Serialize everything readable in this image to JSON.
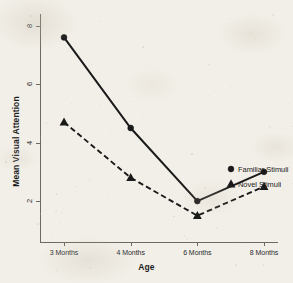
{
  "chart_data": {
    "type": "line",
    "title": "",
    "xlabel": "Age",
    "ylabel": "Mean Visual Attention",
    "categories": [
      "3 Months",
      "4 Months",
      "6 Months",
      "8 Months"
    ],
    "yticks": [
      "2",
      "4",
      "6",
      "8"
    ],
    "ylim": [
      0.6,
      8.4
    ],
    "grid": false,
    "legend_position": "right-inline",
    "series": [
      {
        "name": "Familiar Stimuli",
        "values": [
          7.6,
          4.5,
          2.0,
          3.0
        ],
        "marker": "filled-circle",
        "linestyle": "solid",
        "color": "#1a1a1a"
      },
      {
        "name": "Novel Stimuli",
        "values": [
          4.7,
          2.8,
          1.5,
          2.5
        ],
        "marker": "filled-triangle",
        "linestyle": "dashed",
        "color": "#1a1a1a"
      }
    ]
  },
  "axes": {
    "y_title": "Mean Visual Attention",
    "x_title": "Age"
  },
  "legend": {
    "familiar_label": "Familiar Stimuli",
    "novel_label": "Novel Stimuli"
  },
  "icons": {
    "familiar_marker": "filled-circle-marker",
    "novel_marker": "filled-triangle-marker"
  },
  "colors": {
    "ink": "#1a1a1a",
    "axis": "#6e6a62",
    "paper": "#f2efe8"
  }
}
